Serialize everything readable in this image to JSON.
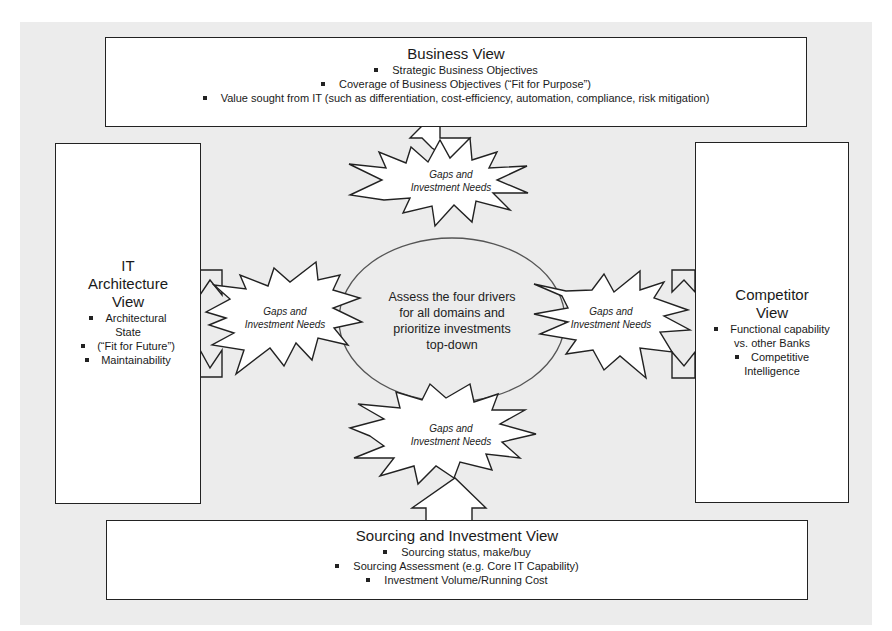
{
  "diagram": {
    "background_color": "#ececec",
    "box_fill": "#ffffff",
    "stroke_color": "#222222",
    "top": {
      "title": "Business View",
      "items": [
        "Strategic Business Objectives",
        "Coverage of Business Objectives (“Fit for Purpose”)",
        "Value sought from IT (such as differentiation,  cost-efficiency, automation, compliance, risk mitigation)"
      ]
    },
    "left": {
      "title_lines": [
        "IT",
        "Architecture",
        "View"
      ],
      "items": [
        {
          "bullet": true,
          "text": "Architectural"
        },
        {
          "bullet": false,
          "text": "State"
        },
        {
          "bullet": true,
          "text": "(“Fit for Future”)"
        },
        {
          "bullet": true,
          "text": "Maintainability"
        }
      ]
    },
    "right": {
      "title_lines": [
        "Competitor",
        "View"
      ],
      "items": [
        {
          "bullet": true,
          "text": "Functional capability"
        },
        {
          "bullet": false,
          "text": "vs. other Banks"
        },
        {
          "bullet": true,
          "text": "Competitive"
        },
        {
          "bullet": false,
          "text": "Intelligence"
        }
      ]
    },
    "bottom": {
      "title": "Sourcing and Investment View",
      "items": [
        "Sourcing status, make/buy",
        "Sourcing Assessment (e.g. Core IT Capability)",
        "Investment Volume/Running Cost"
      ]
    },
    "center": {
      "lines": [
        "Assess the four drivers",
        "for all domains and",
        "prioritize investments",
        "top-down"
      ]
    },
    "bursts": {
      "top": {
        "line1": "Gaps and",
        "line2": "Investment Needs"
      },
      "left": {
        "line1": "Gaps and",
        "line2": "Investment Needs"
      },
      "right": {
        "line1": "Gaps and",
        "line2": "Investment Needs"
      },
      "bottom": {
        "line1": "Gaps and",
        "line2": "Investment Needs"
      }
    }
  }
}
